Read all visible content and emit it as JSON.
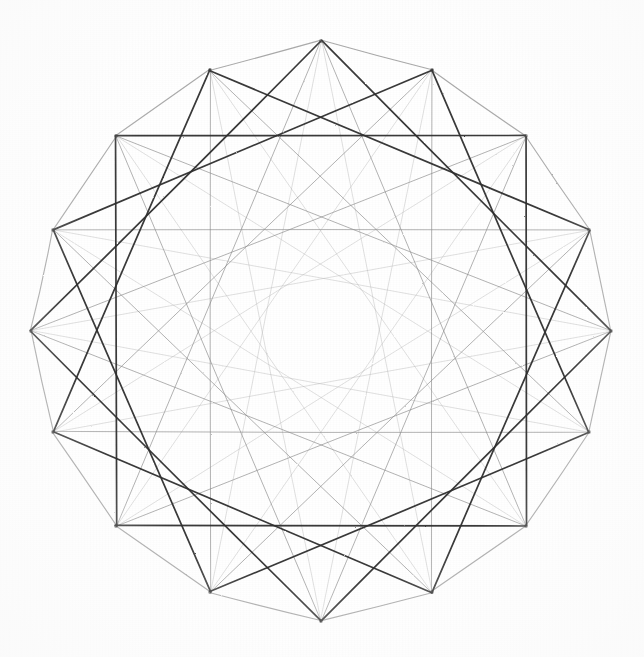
{
  "figure": {
    "medium": "graphite pencil on white paper",
    "background_color": "#ffffff",
    "ink_color": "#3a3a3a",
    "center": {
      "x": 321,
      "y": 331
    },
    "radius": 290,
    "vertex_count": 16,
    "start_angle_deg": 90,
    "rotation_note": "vertex 0 at top, going clockwise",
    "vertices": [
      {
        "index": 0,
        "label": "V0",
        "x": 321,
        "y": 41,
        "angle_deg": 90
      },
      {
        "index": 1,
        "label": "V1",
        "x": 432,
        "y": 70,
        "angle_deg": 67.5
      },
      {
        "index": 2,
        "label": "V2",
        "x": 526,
        "y": 136,
        "angle_deg": 45
      },
      {
        "index": 3,
        "label": "V3",
        "x": 589,
        "y": 230,
        "angle_deg": 22.5
      },
      {
        "index": 4,
        "label": "V4",
        "x": 611,
        "y": 331,
        "angle_deg": 0
      },
      {
        "index": 5,
        "label": "V5",
        "x": 589,
        "y": 432,
        "angle_deg": -22.5
      },
      {
        "index": 6,
        "label": "V6",
        "x": 526,
        "y": 526,
        "angle_deg": -45
      },
      {
        "index": 7,
        "label": "V7",
        "x": 432,
        "y": 592,
        "angle_deg": -67.5
      },
      {
        "index": 8,
        "label": "V8",
        "x": 321,
        "y": 621,
        "angle_deg": -90
      },
      {
        "index": 9,
        "label": "V9",
        "x": 210,
        "y": 592,
        "angle_deg": -112.5
      },
      {
        "index": 10,
        "label": "V10",
        "x": 116,
        "y": 526,
        "angle_deg": -135
      },
      {
        "index": 11,
        "label": "V11",
        "x": 53,
        "y": 432,
        "angle_deg": -157.5
      },
      {
        "index": 12,
        "label": "V12",
        "x": 31,
        "y": 331,
        "angle_deg": 180
      },
      {
        "index": 13,
        "label": "V13",
        "x": 53,
        "y": 230,
        "angle_deg": 157.5
      },
      {
        "index": 14,
        "label": "V14",
        "x": 116,
        "y": 136,
        "angle_deg": 135
      },
      {
        "index": 15,
        "label": "V15",
        "x": 210,
        "y": 70,
        "angle_deg": 112.5
      }
    ],
    "chord_families": [
      {
        "name": "perimeter",
        "step": 1,
        "stroke": "#9a9a9a",
        "width": 1.15,
        "opacity": 0.85,
        "note": "outer 16-gon edges, light graphite"
      },
      {
        "name": "step-4-squares",
        "step": 4,
        "stroke": "#2e2e2e",
        "width": 1.7,
        "opacity": 0.95,
        "note": "four overlapping squares — the darkest, most pressed lines"
      },
      {
        "name": "step-6-star",
        "step": 6,
        "stroke": "#8d8d8d",
        "width": 0.95,
        "opacity": 0.7,
        "note": "long shallow chords forming the faint inner star rosette"
      },
      {
        "name": "step-7-star",
        "step": 7,
        "stroke": "#b2b2b2",
        "width": 0.8,
        "opacity": 0.5,
        "note": "very light near-diameter chords, faintest family"
      }
    ],
    "inner_void": {
      "shape": "circle",
      "center": {
        "x": 321,
        "y": 331
      },
      "approx_radius": 95,
      "note": "blank paper at the centre where no chord passes"
    },
    "stats": {
      "vertices_label": "16 vertices",
      "chords_label": "4 chord families",
      "symmetry_label": "D16 dihedral symmetry"
    }
  }
}
